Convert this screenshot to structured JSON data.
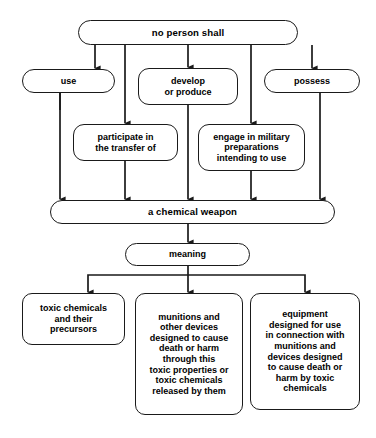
{
  "diagram": {
    "line_color": "#1a1a1a",
    "box_fill": "#ffffff",
    "text_color": "#000000",
    "nodes": {
      "root": "no person shall",
      "use": "use",
      "develop": "develop\nor produce",
      "possess": "possess",
      "participate": "participate in\nthe transfer of",
      "engage": "engage in military\npreparations\nintending to use",
      "weapon": "a chemical weapon",
      "meaning": "meaning",
      "def_toxic": "toxic chemicals\nand their\nprecursors",
      "def_munitions": "munitions and\nother devices\ndesigned to cause\ndeath or harm\nthrough this\ntoxic properties or\ntoxic chemicals\nreleased by them",
      "def_equipment": "equipment\ndesigned for use\nin connection with\nmunitions and\ndevices designed\nto cause death or\nharm by toxic\nchemicals"
    },
    "edges": [
      {
        "from": "root",
        "to": "use"
      },
      {
        "from": "root",
        "to": "weapon"
      },
      {
        "from": "root",
        "to": "develop"
      },
      {
        "from": "root",
        "to": "weapon"
      },
      {
        "from": "root",
        "to": "possess"
      },
      {
        "from": "use",
        "to": "weapon"
      },
      {
        "from": "root",
        "to": "participate"
      },
      {
        "from": "participate",
        "to": "weapon"
      },
      {
        "from": "develop",
        "to": "weapon"
      },
      {
        "from": "root",
        "to": "engage"
      },
      {
        "from": "engage",
        "to": "weapon"
      },
      {
        "from": "possess",
        "to": "weapon"
      },
      {
        "from": "weapon",
        "to": "meaning"
      },
      {
        "from": "meaning",
        "to": "def_toxic"
      },
      {
        "from": "meaning",
        "to": "def_munitions"
      },
      {
        "from": "meaning",
        "to": "def_equipment"
      }
    ]
  }
}
